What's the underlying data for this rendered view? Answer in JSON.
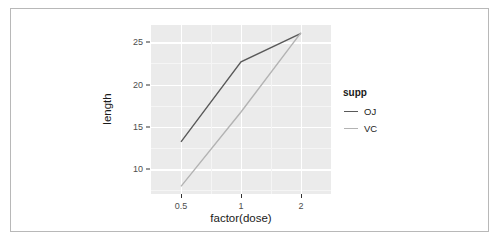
{
  "chart_data": {
    "type": "line",
    "title": "",
    "subtitle": "",
    "xlabel": "factor(dose)",
    "ylabel": "length",
    "x": [
      "0.5",
      "1",
      "2"
    ],
    "categories": [
      "0.5",
      "1",
      "2"
    ],
    "series": [
      {
        "name": "OJ",
        "values": [
          13.23,
          22.7,
          26.06
        ],
        "color": "#595959"
      },
      {
        "name": "VC",
        "values": [
          7.98,
          16.77,
          26.14
        ],
        "color": "#b3b3b3"
      }
    ],
    "xtick_labels": [
      "0.5",
      "1",
      "2"
    ],
    "ytick_labels": [
      "10",
      "15",
      "20",
      "25"
    ],
    "ytick_values": [
      10,
      15,
      20,
      25
    ],
    "yminor_values": [
      7.5,
      12.5,
      17.5,
      22.5,
      27.5
    ],
    "ylim": [
      7.08,
      27.04
    ],
    "grid": true,
    "grid_color": "#ffffff",
    "minor_grid_color": "#f5f5f5",
    "panel_background": "#ebebeb",
    "legend": {
      "title": "supp",
      "position": "right",
      "entries": [
        {
          "label": "OJ",
          "color": "#595959"
        },
        {
          "label": "VC",
          "color": "#b3b3b3"
        }
      ]
    },
    "axis_text_color": "#4d4d4d",
    "axis_title_color": "#1a1a1a",
    "frame_color": "#b8b8b8",
    "background": "#ffffff"
  },
  "axes": {
    "y_ticks": [
      {
        "label": "10",
        "value": 10
      },
      {
        "label": "15",
        "value": 15
      },
      {
        "label": "20",
        "value": 20
      },
      {
        "label": "25",
        "value": 25
      }
    ],
    "x_ticks": [
      {
        "label": "0.5",
        "index": 0
      },
      {
        "label": "1",
        "index": 1
      },
      {
        "label": "2",
        "index": 2
      }
    ],
    "x_title": "factor(dose)",
    "y_title": "length"
  },
  "legend": {
    "title": "supp",
    "items": [
      {
        "label": "OJ"
      },
      {
        "label": "VC"
      }
    ]
  }
}
